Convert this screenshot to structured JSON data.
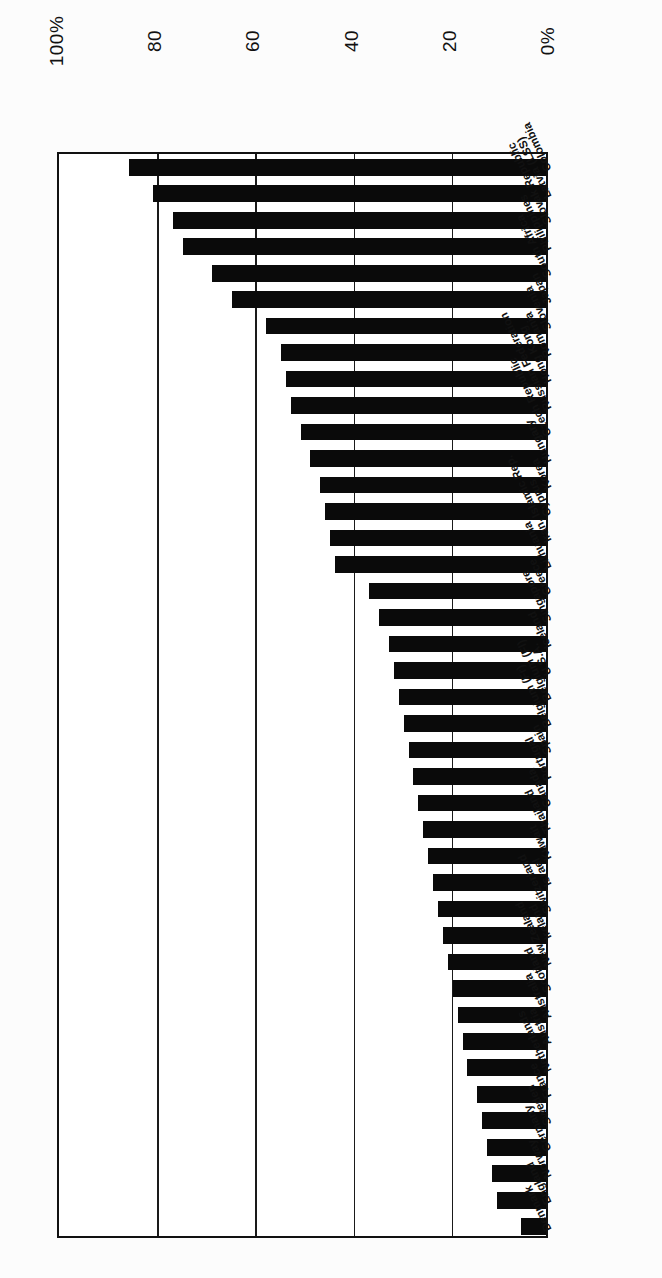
{
  "chart_data": {
    "type": "bar",
    "orientation": "horizontal-rotated",
    "title": "",
    "xlabel": "",
    "ylabel": "",
    "xlim": [
      0,
      100
    ],
    "grid": true,
    "legend": null,
    "axis_ticks": [
      "100%",
      "80",
      "60",
      "40",
      "20",
      "0%"
    ],
    "axis_tick_values": [
      100,
      80,
      60,
      40,
      20,
      0
    ],
    "categories": [
      "Colombia",
      "Latvia (LSS)",
      "Slovak Republic",
      "Philippines",
      "South Africa",
      "Japan",
      "Slovenia",
      "Romania",
      "Hong Kong",
      "Russian Federation",
      "Czech Republic",
      "Hungary",
      "Korea",
      "Cyprus",
      "Iran, Islamic Rep.",
      "Lithuania",
      "Greece",
      "Singapore",
      "Iceland",
      "U.S.A.",
      "Belgium (Fl)",
      "Belgium (Fr)",
      "Spain",
      "Portugal",
      "Canada",
      "Thailand",
      "Kuwait",
      "Israel",
      "Switzerland",
      "Ireland",
      "New Zealand",
      "Scotland",
      "Australia",
      "Austria",
      "Netherlands",
      "France",
      "Sweden",
      "Germany",
      "Norway",
      "England",
      "Denmark"
    ],
    "values": [
      85,
      80,
      76,
      74,
      68,
      64,
      57,
      54,
      53,
      52,
      50,
      48,
      46,
      45,
      44,
      43,
      36,
      34,
      32,
      31,
      30,
      29,
      28,
      27,
      26,
      25,
      24,
      23,
      22,
      21,
      20,
      19,
      18,
      17,
      16,
      14,
      13,
      12,
      11,
      10,
      5
    ]
  }
}
